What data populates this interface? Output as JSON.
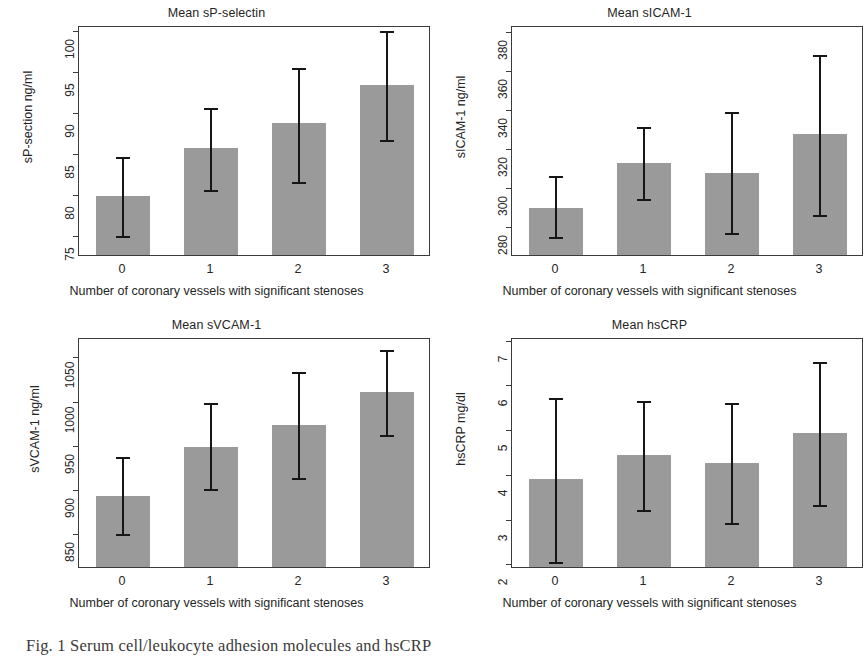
{
  "figure": {
    "xlabel": "Number of coronary vessels with significant stenoses",
    "xcategories": [
      "0",
      "1",
      "2",
      "3"
    ],
    "bar_color": "#9a9a9a",
    "error_color": "#161616",
    "axis_color": "#3b3b3b"
  },
  "caption": {
    "text": "Fig. 1  Serum cell/leukocyte adhesion molecules and hsCRP"
  },
  "chart_data": [
    {
      "type": "bar",
      "title": "Mean sP-selectin",
      "xlabel": "Number of coronary vessels with significant stenoses",
      "ylabel": "sP-section ng/ml",
      "categories": [
        "0",
        "1",
        "2",
        "3"
      ],
      "values": [
        79.8,
        85.6,
        88.7,
        93.3
      ],
      "error_low": [
        75.0,
        80.6,
        81.6,
        86.7
      ],
      "error_high": [
        84.7,
        90.6,
        95.5,
        100.0
      ],
      "yticks": [
        75,
        80,
        85,
        90,
        95,
        100
      ],
      "ytick_labels": [
        "75",
        "80",
        "85",
        "90",
        "95",
        "100"
      ],
      "ylim": [
        72.6,
        100.6
      ],
      "grid": false,
      "legend": "none"
    },
    {
      "type": "bar",
      "title": "Mean sICAM-1",
      "xlabel": "Number of coronary vessels with significant stenoses",
      "ylabel": "sICAM-1 ng/ml",
      "categories": [
        "0",
        "1",
        "2",
        "3"
      ],
      "values": [
        289,
        312,
        307,
        327
      ],
      "error_low": [
        275,
        294,
        277,
        286
      ],
      "error_high": [
        306,
        331,
        339,
        368
      ],
      "yticks": [
        280,
        300,
        320,
        340,
        360,
        380
      ],
      "ytick_labels": [
        "280",
        "300",
        "320",
        "340",
        "360",
        "380"
      ],
      "ylim": [
        265,
        383
      ],
      "grid": false,
      "legend": "none"
    },
    {
      "type": "bar",
      "title": "Mean sVCAM-1",
      "xlabel": "Number of coronary vessels with significant stenoses",
      "ylabel": "sVCAM-1 ng/ml",
      "categories": [
        "0",
        "1",
        "2",
        "3"
      ],
      "values": [
        892,
        948,
        972,
        1010
      ],
      "error_low": [
        851,
        901,
        914,
        962
      ],
      "error_high": [
        937,
        998,
        1034,
        1058
      ],
      "yticks": [
        850,
        900,
        950,
        1000,
        1050
      ],
      "ytick_labels": [
        "850",
        "900",
        "950",
        "1000",
        "1050"
      ],
      "ylim": [
        812,
        1072
      ],
      "grid": false,
      "legend": "none"
    },
    {
      "type": "bar",
      "title": "Mean hsCRP",
      "xlabel": "Number of coronary vessels with significant stenoses",
      "ylabel": "hsCRP mg/dl",
      "categories": [
        "0",
        "1",
        "2",
        "3"
      ],
      "values": [
        3.88,
        4.42,
        4.24,
        4.92
      ],
      "error_low": [
        2.06,
        3.22,
        2.93,
        3.32
      ],
      "error_high": [
        5.72,
        5.66,
        5.6,
        6.53
      ],
      "yticks": [
        2,
        3,
        4,
        5,
        6,
        7
      ],
      "ytick_labels": [
        "2",
        "3",
        "4",
        "5",
        "6",
        "7"
      ],
      "ylim": [
        1.92,
        7.06
      ],
      "grid": false,
      "legend": "none"
    }
  ]
}
